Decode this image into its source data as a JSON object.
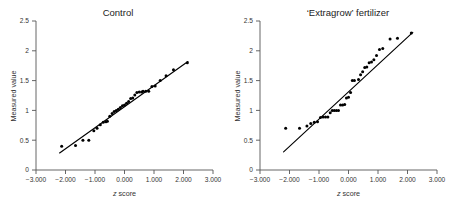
{
  "figure": {
    "background_color": "#ffffff",
    "point_color": "#000000",
    "line_color": "#000000",
    "axis_color": "#555555"
  },
  "panels": [
    {
      "id": "control",
      "title": "Control",
      "xlabel_italic": "z",
      "xlabel_rest": " score",
      "ylabel": "Measured value"
    },
    {
      "id": "extragrow",
      "title": "‘Extragrow’ fertilizer",
      "xlabel_italic": "z",
      "xlabel_rest": " score",
      "ylabel": "Measured value"
    }
  ],
  "axes": {
    "x_ticks": [
      "−3.000",
      "−2.000",
      "−1.000",
      "0.000",
      "1.000",
      "2.000",
      "3.000"
    ],
    "x_tick_values": [
      -3,
      -2,
      -1,
      0,
      1,
      2,
      3
    ],
    "y_ticks": [
      "0",
      "0.5",
      "1",
      "1.5",
      "2",
      "2.5"
    ],
    "y_tick_values": [
      0,
      0.5,
      1,
      1.5,
      2,
      2.5
    ],
    "xlim": [
      -3,
      3
    ],
    "ylim": [
      0,
      2.5
    ],
    "grid": false
  },
  "chart_data": [
    {
      "type": "scatter",
      "id": "control",
      "title": "Control",
      "xlabel": "z score",
      "ylabel": "Measured value",
      "xlim": [
        -3,
        3
      ],
      "ylim": [
        0,
        2.5
      ],
      "grid": false,
      "legend": null,
      "x": [
        -2.13,
        -1.66,
        -1.41,
        -1.21,
        -1.04,
        -0.93,
        -0.82,
        -0.72,
        -0.63,
        -0.58,
        -0.5,
        -0.42,
        -0.35,
        -0.28,
        -0.21,
        -0.14,
        -0.07,
        0.0,
        0.07,
        0.14,
        0.21,
        0.28,
        0.35,
        0.42,
        0.5,
        0.58,
        0.63,
        0.72,
        0.82,
        0.93,
        1.04,
        1.21,
        1.41,
        1.66,
        2.13
      ],
      "y": [
        0.4,
        0.41,
        0.5,
        0.5,
        0.66,
        0.7,
        0.76,
        0.8,
        0.81,
        0.82,
        0.9,
        0.95,
        0.98,
        1.0,
        1.02,
        1.05,
        1.08,
        1.09,
        1.12,
        1.15,
        1.2,
        1.21,
        1.26,
        1.3,
        1.31,
        1.31,
        1.32,
        1.32,
        1.32,
        1.4,
        1.41,
        1.5,
        1.58,
        1.68,
        1.8
      ],
      "fit_line": {
        "x": [
          -2.2,
          2.15
        ],
        "y": [
          0.285,
          1.82
        ]
      }
    },
    {
      "type": "scatter",
      "id": "extragrow",
      "title": "‘Extragrow’ fertilizer",
      "xlabel": "z score",
      "ylabel": "Measured value",
      "xlim": [
        -3,
        3
      ],
      "ylim": [
        0,
        2.5
      ],
      "grid": false,
      "legend": null,
      "x": [
        -2.13,
        -1.66,
        -1.41,
        -1.28,
        -1.16,
        -1.05,
        -0.95,
        -0.86,
        -0.78,
        -0.7,
        -0.62,
        -0.55,
        -0.48,
        -0.41,
        -0.34,
        -0.27,
        -0.2,
        -0.13,
        -0.07,
        0.0,
        0.07,
        0.13,
        0.2,
        0.34,
        0.41,
        0.48,
        0.55,
        0.62,
        0.7,
        0.78,
        0.86,
        0.95,
        1.05,
        1.16,
        1.41,
        1.66,
        2.13
      ],
      "y": [
        0.7,
        0.7,
        0.74,
        0.78,
        0.8,
        0.81,
        0.88,
        0.89,
        0.89,
        0.89,
        0.96,
        1.0,
        1.0,
        1.0,
        1.0,
        1.09,
        1.09,
        1.1,
        1.21,
        1.22,
        1.3,
        1.5,
        1.5,
        1.52,
        1.6,
        1.65,
        1.72,
        1.73,
        1.8,
        1.81,
        1.85,
        1.92,
        2.02,
        2.04,
        2.2,
        2.21,
        2.3
      ],
      "fit_line": {
        "x": [
          -2.2,
          2.18
        ],
        "y": [
          0.305,
          2.31
        ]
      }
    }
  ]
}
